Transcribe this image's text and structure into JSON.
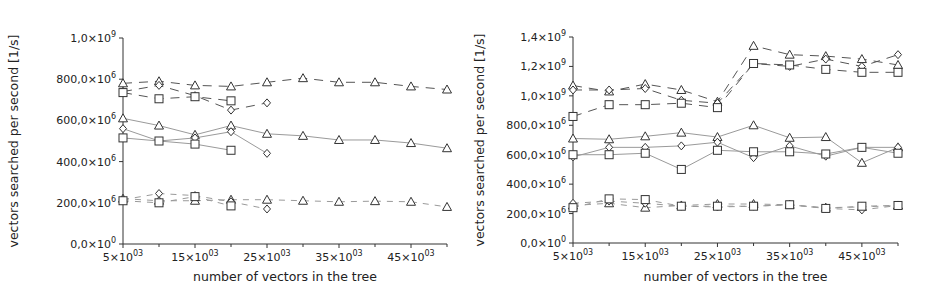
{
  "chart_data": [
    {
      "type": "line",
      "id": "left",
      "title": "",
      "xlabel": "number of vectors in the tree",
      "ylabel": "vectors searched per second [1/s]",
      "xlim": [
        5000,
        50000
      ],
      "ylim": [
        0,
        1000000000
      ],
      "grid": false,
      "legend": null,
      "x_ticks": [
        {
          "value": 5000,
          "label": "5×10",
          "exp": "03"
        },
        {
          "value": 15000,
          "label": "15×10",
          "exp": "03"
        },
        {
          "value": 25000,
          "label": "25×10",
          "exp": "03"
        },
        {
          "value": 35000,
          "label": "35×10",
          "exp": "03"
        },
        {
          "value": 45000,
          "label": "45×10",
          "exp": "03"
        }
      ],
      "x_minor_ticks": [
        10000,
        20000,
        30000,
        40000,
        50000
      ],
      "y_ticks": [
        {
          "value": 0,
          "label": "0,0×10",
          "exp": "0"
        },
        {
          "value": 200000000,
          "label": "200,0×10",
          "exp": "6"
        },
        {
          "value": 400000000,
          "label": "400,0×10",
          "exp": "6"
        },
        {
          "value": 600000000,
          "label": "600,0×10",
          "exp": "6"
        },
        {
          "value": 800000000,
          "label": "800,0×10",
          "exp": "6"
        },
        {
          "value": 1000000000,
          "label": "1,0×10",
          "exp": "9"
        }
      ],
      "series": [
        {
          "name": "dashed-triangle-high",
          "marker": "triangle",
          "dash": "long",
          "x": [
            5000,
            10000,
            15000,
            20000,
            25000,
            30000,
            35000,
            40000,
            45000,
            50000
          ],
          "values": [
            780000000.0,
            790000000.0,
            770000000.0,
            765000000.0,
            785000000.0,
            805000000.0,
            785000000.0,
            785000000.0,
            765000000.0,
            750000000.0
          ]
        },
        {
          "name": "dashed-diamond-high",
          "marker": "diamond",
          "dash": "long",
          "x": [
            5000,
            10000,
            15000,
            20000,
            25000
          ],
          "values": [
            740000000.0,
            770000000.0,
            720000000.0,
            650000000.0,
            685000000.0
          ]
        },
        {
          "name": "dashed-square-high",
          "marker": "square",
          "dash": "long",
          "x": [
            5000,
            10000,
            15000,
            20000
          ],
          "values": [
            735000000.0,
            705000000.0,
            715000000.0,
            695000000.0
          ]
        },
        {
          "name": "solid-triangle-mid",
          "marker": "triangle",
          "dash": "solid",
          "x": [
            5000,
            10000,
            15000,
            20000,
            25000,
            30000,
            35000,
            40000,
            45000,
            50000
          ],
          "values": [
            610000000.0,
            575000000.0,
            530000000.0,
            575000000.0,
            535000000.0,
            525000000.0,
            505000000.0,
            505000000.0,
            490000000.0,
            465000000.0
          ]
        },
        {
          "name": "solid-diamond-mid",
          "marker": "diamond",
          "dash": "solid",
          "x": [
            5000,
            10000,
            15000,
            20000,
            25000
          ],
          "values": [
            560000000.0,
            500000000.0,
            515000000.0,
            545000000.0,
            440000000.0
          ]
        },
        {
          "name": "solid-square-mid",
          "marker": "square",
          "dash": "solid",
          "x": [
            5000,
            10000,
            15000,
            20000
          ],
          "values": [
            515000000.0,
            500000000.0,
            485000000.0,
            455000000.0
          ]
        },
        {
          "name": "dashed-triangle-low",
          "marker": "triangle",
          "dash": "short",
          "x": [
            5000,
            10000,
            15000,
            20000,
            25000,
            30000,
            35000,
            40000,
            45000,
            50000
          ],
          "values": [
            220000000.0,
            210000000.0,
            210000000.0,
            215000000.0,
            215000000.0,
            210000000.0,
            205000000.0,
            208000000.0,
            205000000.0,
            180000000.0
          ]
        },
        {
          "name": "dashed-diamond-low",
          "marker": "diamond",
          "dash": "short",
          "x": [
            5000,
            10000,
            15000,
            20000,
            25000
          ],
          "values": [
            215000000.0,
            245000000.0,
            235000000.0,
            205000000.0,
            170000000.0
          ]
        },
        {
          "name": "dashed-square-low",
          "marker": "square",
          "dash": "short",
          "x": [
            5000,
            10000,
            15000,
            20000
          ],
          "values": [
            210000000.0,
            200000000.0,
            230000000.0,
            185000000.0
          ]
        }
      ]
    },
    {
      "type": "line",
      "id": "right",
      "title": "",
      "xlabel": "number of vectors in the tree",
      "ylabel": "vectors searched per second [1/s]",
      "xlim": [
        5000,
        50000
      ],
      "ylim": [
        0,
        1400000000
      ],
      "grid": false,
      "legend": null,
      "x_ticks": [
        {
          "value": 5000,
          "label": "5×10",
          "exp": "03"
        },
        {
          "value": 15000,
          "label": "15×10",
          "exp": "03"
        },
        {
          "value": 25000,
          "label": "25×10",
          "exp": "03"
        },
        {
          "value": 35000,
          "label": "35×10",
          "exp": "03"
        },
        {
          "value": 45000,
          "label": "45×10",
          "exp": "03"
        }
      ],
      "x_minor_ticks": [
        10000,
        20000,
        30000,
        40000,
        50000
      ],
      "y_ticks": [
        {
          "value": 0,
          "label": "0,0×10",
          "exp": "0"
        },
        {
          "value": 200000000,
          "label": "200,0×10",
          "exp": "6"
        },
        {
          "value": 400000000,
          "label": "400,0×10",
          "exp": "6"
        },
        {
          "value": 600000000,
          "label": "600,0×10",
          "exp": "6"
        },
        {
          "value": 800000000,
          "label": "800,0×10",
          "exp": "6"
        },
        {
          "value": 1000000000,
          "label": "1,0×10",
          "exp": "9"
        },
        {
          "value": 1200000000,
          "label": "1,2×10",
          "exp": "9"
        },
        {
          "value": 1400000000,
          "label": "1,4×10",
          "exp": "9"
        }
      ],
      "series": [
        {
          "name": "dashed-triangle-high",
          "marker": "triangle",
          "dash": "long",
          "x": [
            5000,
            10000,
            15000,
            20000,
            25000,
            30000,
            35000,
            40000,
            45000,
            50000
          ],
          "values": [
            1070000000.0,
            1030000000.0,
            1080000000.0,
            1040000000.0,
            960000000.0,
            1340000000.0,
            1280000000.0,
            1270000000.0,
            1250000000.0,
            1210000000.0
          ]
        },
        {
          "name": "dashed-diamond-high",
          "marker": "diamond",
          "dash": "long",
          "x": [
            5000,
            10000,
            15000,
            20000,
            25000,
            30000,
            35000,
            40000,
            45000,
            50000
          ],
          "values": [
            1040000000.0,
            1040000000.0,
            1050000000.0,
            970000000.0,
            950000000.0,
            1220000000.0,
            1200000000.0,
            1250000000.0,
            1200000000.0,
            1280000000.0
          ]
        },
        {
          "name": "dashed-square-high",
          "marker": "square",
          "dash": "long",
          "x": [
            5000,
            10000,
            15000,
            20000,
            25000,
            30000,
            35000,
            40000,
            45000,
            50000
          ],
          "values": [
            860000000.0,
            940000000.0,
            940000000.0,
            950000000.0,
            920000000.0,
            1220000000.0,
            1210000000.0,
            1180000000.0,
            1160000000.0,
            1160000000.0
          ]
        },
        {
          "name": "solid-triangle-mid",
          "marker": "triangle",
          "dash": "solid",
          "x": [
            5000,
            10000,
            15000,
            20000,
            25000,
            30000,
            35000,
            40000,
            45000,
            50000
          ],
          "values": [
            710000000.0,
            705000000.0,
            725000000.0,
            750000000.0,
            720000000.0,
            800000000.0,
            715000000.0,
            720000000.0,
            545000000.0,
            650000000.0
          ]
        },
        {
          "name": "solid-diamond-mid",
          "marker": "diamond",
          "dash": "solid",
          "x": [
            5000,
            10000,
            15000,
            20000,
            25000,
            30000,
            35000,
            40000,
            45000,
            50000
          ],
          "values": [
            585000000.0,
            650000000.0,
            650000000.0,
            660000000.0,
            685000000.0,
            580000000.0,
            660000000.0,
            590000000.0,
            650000000.0,
            650000000.0
          ]
        },
        {
          "name": "solid-square-mid",
          "marker": "square",
          "dash": "solid",
          "x": [
            5000,
            10000,
            15000,
            20000,
            25000,
            30000,
            35000,
            40000,
            45000,
            50000
          ],
          "values": [
            600000000.0,
            600000000.0,
            610000000.0,
            500000000.0,
            630000000.0,
            620000000.0,
            620000000.0,
            605000000.0,
            650000000.0,
            610000000.0
          ]
        },
        {
          "name": "dashed-triangle-low",
          "marker": "triangle",
          "dash": "short",
          "x": [
            5000,
            10000,
            15000,
            20000,
            25000,
            30000,
            35000,
            40000,
            45000,
            50000
          ],
          "values": [
            255000000.0,
            270000000.0,
            240000000.0,
            255000000.0,
            265000000.0,
            265000000.0,
            260000000.0,
            240000000.0,
            245000000.0,
            255000000.0
          ]
        },
        {
          "name": "dashed-diamond-low",
          "marker": "diamond",
          "dash": "short",
          "x": [
            5000,
            10000,
            15000,
            20000,
            25000,
            30000,
            35000,
            40000,
            45000,
            50000
          ],
          "values": [
            270000000.0,
            285000000.0,
            270000000.0,
            250000000.0,
            245000000.0,
            250000000.0,
            260000000.0,
            235000000.0,
            225000000.0,
            255000000.0
          ]
        },
        {
          "name": "dashed-square-low",
          "marker": "square",
          "dash": "short",
          "x": [
            5000,
            10000,
            15000,
            20000,
            25000,
            30000,
            35000,
            40000,
            45000,
            50000
          ],
          "values": [
            240000000.0,
            300000000.0,
            295000000.0,
            250000000.0,
            250000000.0,
            250000000.0,
            260000000.0,
            235000000.0,
            250000000.0,
            255000000.0
          ]
        }
      ]
    }
  ],
  "style": {
    "axis_color": "#333333",
    "line_dark": "#555555",
    "line_light": "#9a9a9a",
    "marker_color": "#333333",
    "background": "#ffffff"
  }
}
